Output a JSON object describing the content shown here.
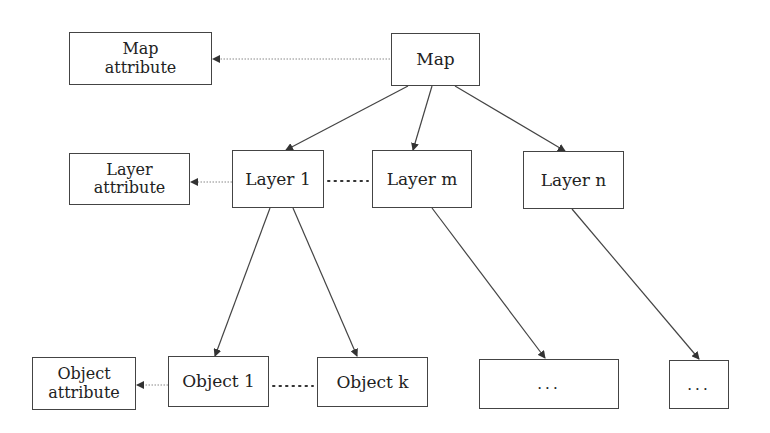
{
  "nodes": {
    "map": {
      "label": "Map"
    },
    "map_attribute": {
      "line1": "Map",
      "line2": "attribute"
    },
    "layer1": {
      "label": "Layer 1"
    },
    "layer_m": {
      "label": "Layer m"
    },
    "layer_n": {
      "label": "Layer n"
    },
    "layer_attribute": {
      "line1": "Layer",
      "line2": "attribute"
    },
    "object1": {
      "label": "Object 1"
    },
    "object_k": {
      "label": "Object k"
    },
    "object_attribute": {
      "line1": "Object",
      "line2": "attribute"
    },
    "children_m": {
      "label": "..."
    },
    "children_n": {
      "label": "..."
    }
  },
  "edges": [
    {
      "from": "map",
      "to": "map_attribute",
      "style": "dotted-arrow"
    },
    {
      "from": "map",
      "to": "layer1",
      "style": "solid-arrow"
    },
    {
      "from": "map",
      "to": "layer_m",
      "style": "solid-arrow"
    },
    {
      "from": "map",
      "to": "layer_n",
      "style": "solid-arrow"
    },
    {
      "from": "layer1",
      "to": "layer_attribute",
      "style": "dotted-arrow"
    },
    {
      "from": "layer1",
      "to": "layer_m",
      "style": "dotted-line"
    },
    {
      "from": "layer1",
      "to": "object1",
      "style": "solid-arrow"
    },
    {
      "from": "layer1",
      "to": "object_k",
      "style": "solid-arrow"
    },
    {
      "from": "layer_m",
      "to": "children_m",
      "style": "solid-arrow"
    },
    {
      "from": "layer_n",
      "to": "children_n",
      "style": "solid-arrow"
    },
    {
      "from": "object1",
      "to": "object_attribute",
      "style": "dotted-arrow"
    },
    {
      "from": "object1",
      "to": "object_k",
      "style": "dotted-line"
    }
  ],
  "colors": {
    "stroke": "#444444",
    "dotted": "#888888",
    "text": "#222222"
  }
}
